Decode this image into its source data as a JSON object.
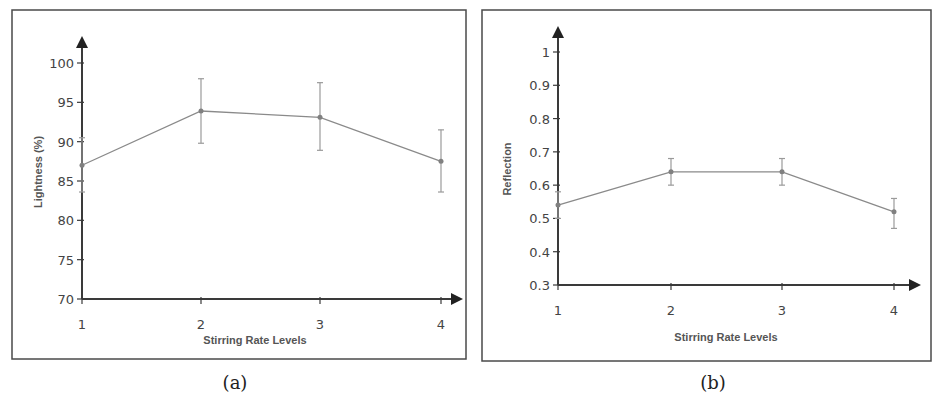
{
  "figure": {
    "panels": [
      {
        "id": "a",
        "caption": "(a)"
      },
      {
        "id": "b",
        "caption": "(b)"
      }
    ]
  },
  "chart_data": [
    {
      "type": "line",
      "panel": "(a)",
      "title": "",
      "xlabel": "Stirring Rate Levels",
      "ylabel": "Lightness (%)",
      "x": [
        1,
        2,
        3,
        4
      ],
      "x_tick_labels": [
        "1",
        "2",
        "3",
        "4"
      ],
      "y_tick_labels": [
        "70",
        "75",
        "80",
        "85",
        "90",
        "95",
        "100"
      ],
      "ylim": [
        70,
        100
      ],
      "grid": false,
      "legend": null,
      "series": [
        {
          "name": "Lightness",
          "values": [
            87.0,
            93.9,
            93.1,
            87.5
          ],
          "error_upper": [
            90.5,
            98.0,
            97.5,
            91.5
          ],
          "error_lower": [
            83.6,
            89.8,
            88.9,
            83.6
          ]
        }
      ]
    },
    {
      "type": "line",
      "panel": "(b)",
      "title": "",
      "xlabel": "Stirring Rate Levels",
      "ylabel": "Reflection",
      "x": [
        1,
        2,
        3,
        4
      ],
      "x_tick_labels": [
        "1",
        "2",
        "3",
        "4"
      ],
      "y_tick_labels": [
        "0.3",
        "0.4",
        "0.5",
        "0.6",
        "0.7",
        "0.8",
        "0.9",
        "1"
      ],
      "ylim": [
        0.3,
        1.0
      ],
      "grid": false,
      "legend": null,
      "series": [
        {
          "name": "Reflection",
          "values": [
            0.54,
            0.64,
            0.64,
            0.52
          ],
          "error_upper": [
            0.58,
            0.68,
            0.68,
            0.56
          ],
          "error_lower": [
            0.5,
            0.6,
            0.6,
            0.47
          ]
        }
      ]
    }
  ]
}
